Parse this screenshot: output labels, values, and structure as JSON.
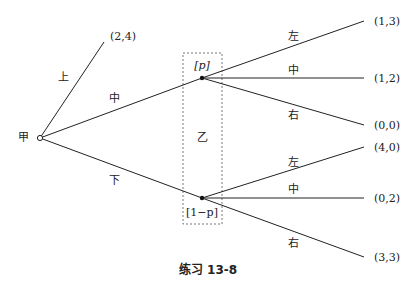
{
  "diagram": {
    "type": "game-tree",
    "caption": "练习 13-8",
    "players": {
      "root": "甲",
      "info_set": "乙"
    },
    "root_actions": {
      "up": "上",
      "middle": "中",
      "down": "下"
    },
    "up_payoff": "(2,4)",
    "beliefs": {
      "upper": "[p]",
      "lower": "[1−p]"
    },
    "upper_node": {
      "actions": [
        "左",
        "中",
        "右"
      ],
      "payoffs": [
        "(1,3)",
        "(1,2)",
        "(0,0)"
      ]
    },
    "lower_node": {
      "actions": [
        "左",
        "中",
        "右"
      ],
      "payoffs": [
        "(4,0)",
        "(0,2)",
        "(3,3)"
      ]
    }
  }
}
